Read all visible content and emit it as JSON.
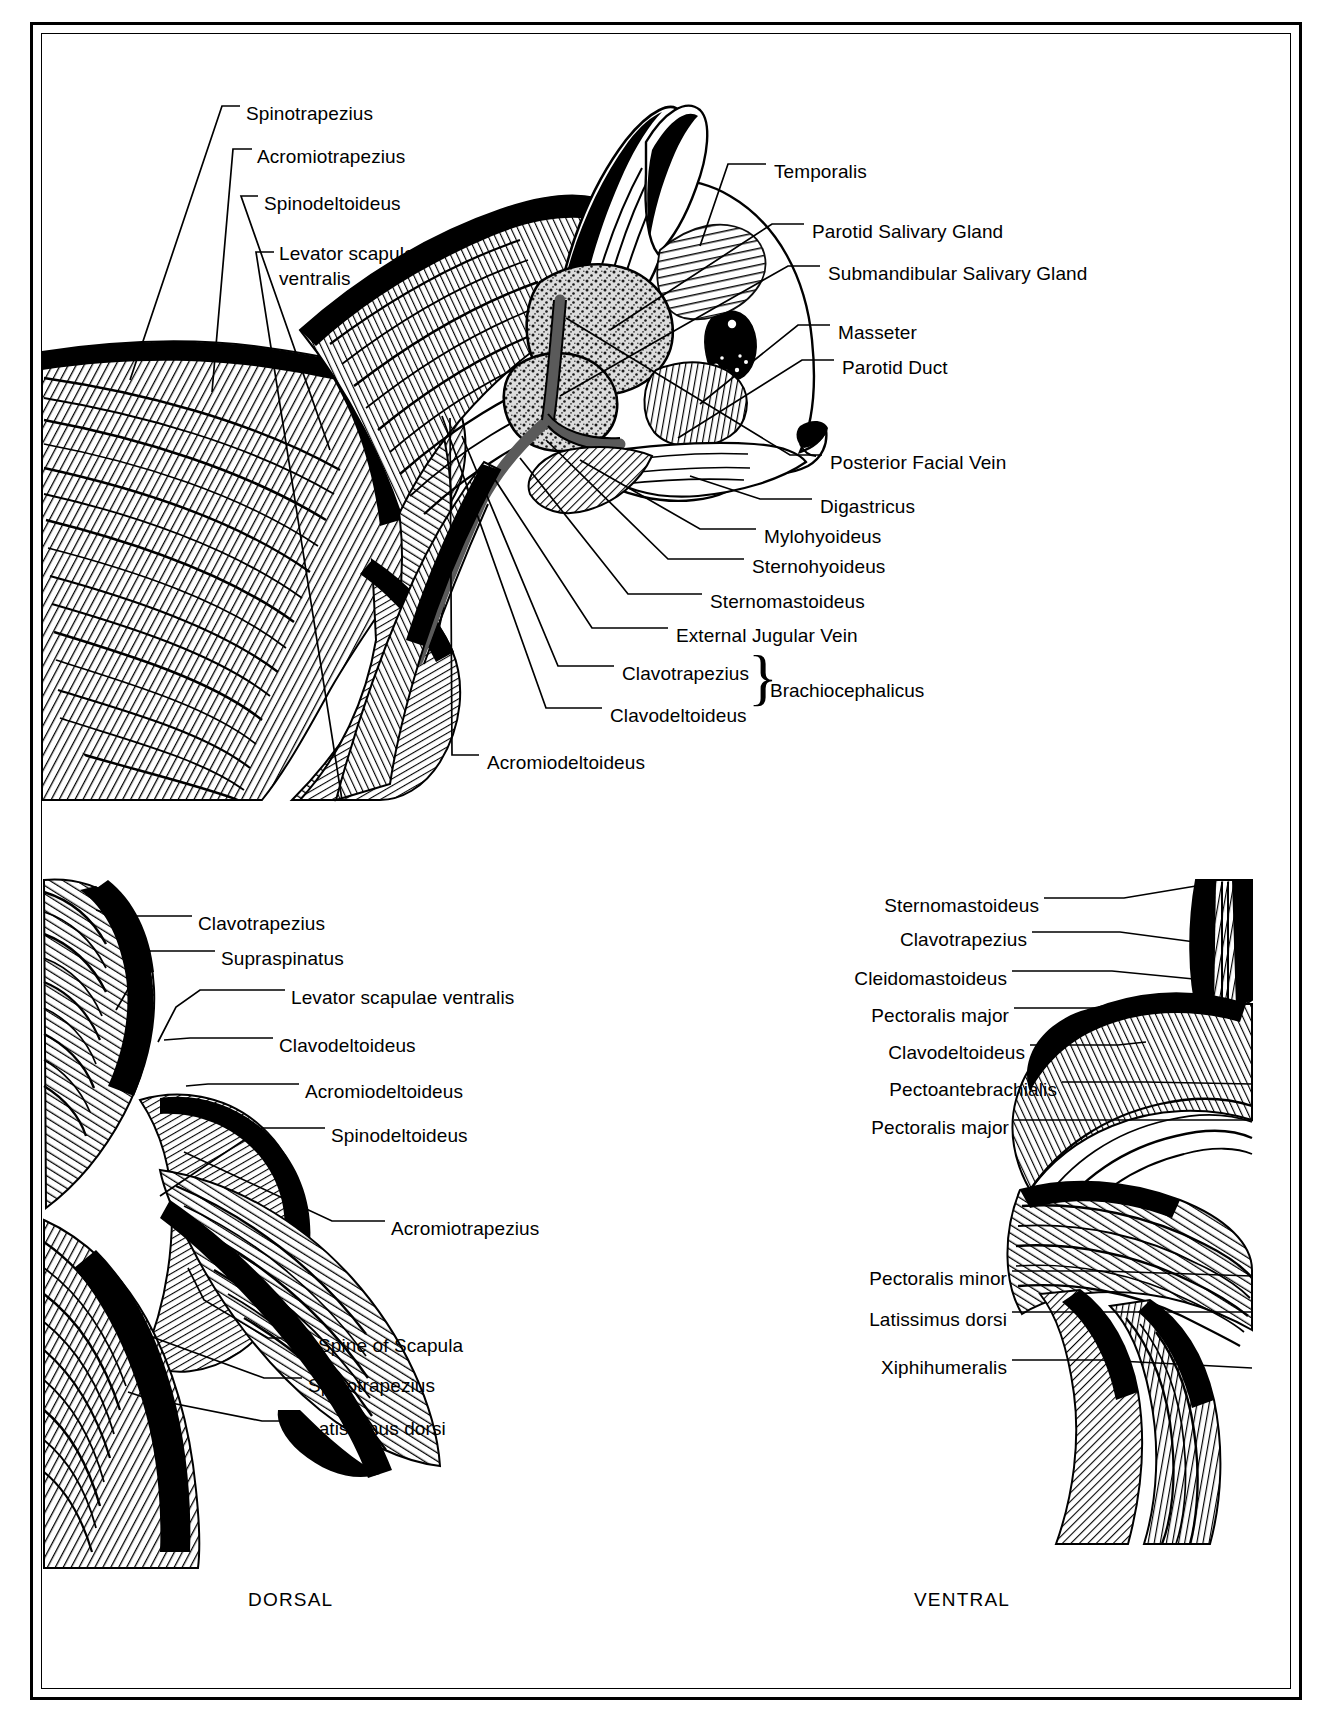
{
  "figure": {
    "captions": {
      "dorsal": "DORSAL",
      "ventral": "VENTRAL"
    }
  },
  "panel_lateral": {
    "name": "lateral-head-neck-view",
    "labels": [
      {
        "id": "spinotrapezius",
        "text": "Spinotrapezius",
        "x": 246,
        "y": 101
      },
      {
        "id": "acromiotrapezius",
        "text": "Acromiotrapezius",
        "x": 257,
        "y": 144
      },
      {
        "id": "spinodeltoideus",
        "text": "Spinodeltoideus",
        "x": 264,
        "y": 191
      },
      {
        "id": "levator-scapulae-ventralis",
        "text": "Levator scapulae ventralis",
        "x": 279,
        "y": 241
      },
      {
        "id": "temporalis",
        "text": "Temporalis",
        "x": 774,
        "y": 159
      },
      {
        "id": "parotid-salivary-gland",
        "text": "Parotid Salivary Gland",
        "x": 812,
        "y": 219
      },
      {
        "id": "submandibular-salivary-gland",
        "text": "Submandibular Salivary Gland",
        "x": 828,
        "y": 261
      },
      {
        "id": "masseter",
        "text": "Masseter",
        "x": 838,
        "y": 320
      },
      {
        "id": "parotid-duct",
        "text": "Parotid Duct",
        "x": 842,
        "y": 355
      },
      {
        "id": "posterior-facial-vein",
        "text": "Posterior Facial Vein",
        "x": 830,
        "y": 450
      },
      {
        "id": "digastricus",
        "text": "Digastricus",
        "x": 820,
        "y": 494
      },
      {
        "id": "mylohyoideus",
        "text": "Mylohyoideus",
        "x": 764,
        "y": 524
      },
      {
        "id": "sternohyoideus",
        "text": "Sternohyoideus",
        "x": 752,
        "y": 554
      },
      {
        "id": "sternomastoideus",
        "text": "Sternomastoideus",
        "x": 710,
        "y": 589
      },
      {
        "id": "external-jugular-vein",
        "text": "External Jugular Vein",
        "x": 676,
        "y": 623
      },
      {
        "id": "clavotrapezius",
        "text": "Clavotrapezius",
        "x": 622,
        "y": 661
      },
      {
        "id": "clavodeltoideus",
        "text": "Clavodeltoideus",
        "x": 610,
        "y": 703
      },
      {
        "id": "acromiodeltoideus",
        "text": "Acromiodeltoideus",
        "x": 487,
        "y": 750
      }
    ],
    "group": {
      "id": "brachiocephalicus",
      "text": "Brachiocephalicus",
      "x": 770,
      "y": 680,
      "members": [
        "Clavotrapezius",
        "Clavodeltoideus"
      ]
    }
  },
  "panel_dorsal": {
    "name": "dorsal-shoulder-view",
    "caption": "DORSAL",
    "caption_pos": {
      "x": 248,
      "y": 1595
    },
    "labels": [
      {
        "id": "clavotrapezius",
        "text": "Clavotrapezius",
        "x": 198,
        "y": 911
      },
      {
        "id": "supraspinatus",
        "text": "Supraspinatus",
        "x": 221,
        "y": 946
      },
      {
        "id": "levator-scapulae-ventralis",
        "text": "Levator scapulae ventralis",
        "x": 291,
        "y": 985
      },
      {
        "id": "clavodeltoideus",
        "text": "Clavodeltoideus",
        "x": 279,
        "y": 1033
      },
      {
        "id": "acromiodeltoideus",
        "text": "Acromiodeltoideus",
        "x": 305,
        "y": 1079
      },
      {
        "id": "spinodeltoideus",
        "text": "Spinodeltoideus",
        "x": 331,
        "y": 1123
      },
      {
        "id": "acromiotrapezius",
        "text": "Acromiotrapezius",
        "x": 391,
        "y": 1216
      },
      {
        "id": "spine-of-scapula",
        "text": "Spine of Scapula",
        "x": 318,
        "y": 1333
      },
      {
        "id": "spinotrapezius",
        "text": "Spinotrapezius",
        "x": 308,
        "y": 1373
      },
      {
        "id": "latissimus-dorsi",
        "text": "Latissimus dorsi",
        "x": 308,
        "y": 1416
      }
    ]
  },
  "panel_ventral": {
    "name": "ventral-shoulder-view",
    "caption": "VENTRAL",
    "caption_pos": {
      "x": 914,
      "y": 1595
    },
    "labels": [
      {
        "id": "sternomastoideus",
        "text": "Sternomastoideus",
        "x": 1034,
        "y": 893
      },
      {
        "id": "clavotrapezius",
        "text": "Clavotrapezius",
        "x": 1020,
        "y": 927
      },
      {
        "id": "cleidomastoideus",
        "text": "Cleidomastoideus",
        "x": 1000,
        "y": 966
      },
      {
        "id": "pectoralis-major-1",
        "text": "Pectoralis major",
        "x": 1003,
        "y": 1003
      },
      {
        "id": "clavodeltoideus",
        "text": "Clavodeltoideus",
        "x": 1018,
        "y": 1040
      },
      {
        "id": "pectoantebrachialis",
        "text": "Pectoantebrachialis",
        "x": 952,
        "y": 1077
      },
      {
        "id": "pectoralis-major-2",
        "text": "Pectoralis major",
        "x": 1002,
        "y": 1115
      },
      {
        "id": "pectoralis-minor",
        "text": "Pectoralis minor",
        "x": 1002,
        "y": 1266
      },
      {
        "id": "latissimus-dorsi",
        "text": "Latissimus dorsi",
        "x": 1002,
        "y": 1307
      },
      {
        "id": "xiphihumeralis",
        "text": "Xiphihumeralis",
        "x": 1002,
        "y": 1355
      }
    ]
  },
  "colors": {
    "ink": "#000000",
    "paper": "#ffffff",
    "gland_fill": "#d8d8d8",
    "vein_fill": "#6e6e6e"
  }
}
